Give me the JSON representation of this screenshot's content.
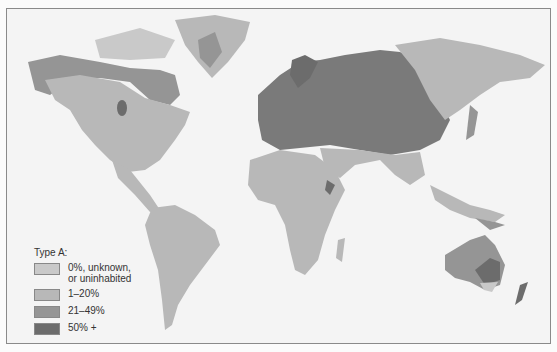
{
  "map": {
    "subject": "World distribution of blood type A",
    "colors": {
      "ocean": "#f4f4f4",
      "cat0": "#c9c9c9",
      "cat1": "#b8b8b8",
      "cat2": "#959595",
      "cat3": "#6c6c6c",
      "border": "#8a8a8a"
    }
  },
  "legend": {
    "title": "Type A:",
    "items": [
      {
        "label": "0%, unknown, or uninhabited",
        "color": "#c9c9c9"
      },
      {
        "label": "1–20%",
        "color": "#b8b8b8"
      },
      {
        "label": "21–49%",
        "color": "#959595"
      },
      {
        "label": "50% +",
        "color": "#6c6c6c"
      }
    ]
  }
}
